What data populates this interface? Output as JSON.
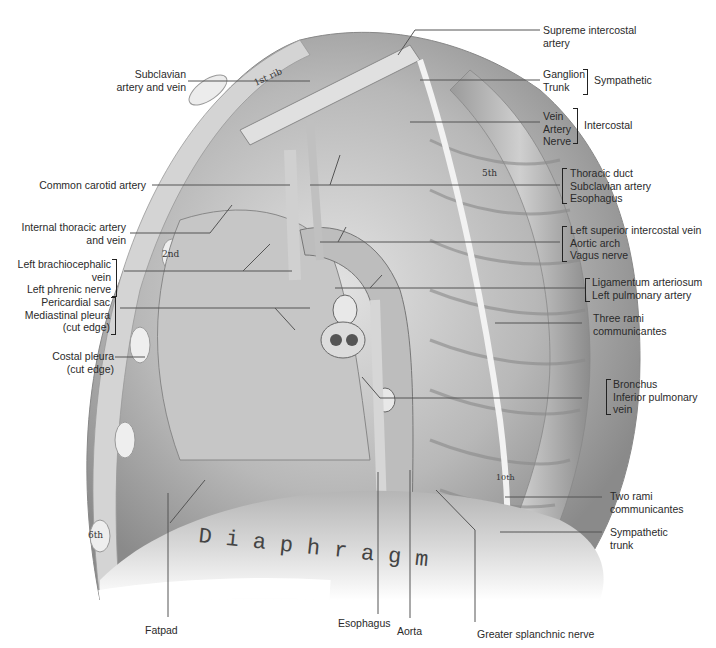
{
  "figure": {
    "type": "anatomical illustration",
    "diaphragm_text": "Diaphragm",
    "rib_labels": [
      "1st rib",
      "2nd",
      "5th",
      "6th",
      "10th"
    ]
  },
  "labels_left": [
    {
      "id": "subclavian",
      "lines": [
        "Subclavian",
        "artery and vein"
      ]
    },
    {
      "id": "common-carotid",
      "lines": [
        "Common carotid artery"
      ]
    },
    {
      "id": "internal-thoracic",
      "lines": [
        "Internal thoracic artery",
        "and vein"
      ]
    },
    {
      "id": "brachiocephalic-phrenic",
      "lines": [
        "Left brachiocephalic",
        "vein",
        "Left phrenic nerve"
      ]
    },
    {
      "id": "pericardial",
      "lines": [
        "Pericardial sac",
        "Mediastinal pleura",
        "(cut edge)"
      ]
    },
    {
      "id": "costal-pleura",
      "lines": [
        "Costal pleura",
        "(cut edge)"
      ]
    }
  ],
  "labels_right": [
    {
      "id": "supreme-intercostal",
      "lines": [
        "Supreme intercostal",
        "artery"
      ]
    },
    {
      "id": "sympathetic-group",
      "lines": [
        "Ganglion",
        "Trunk"
      ],
      "group": "Sympathetic"
    },
    {
      "id": "intercostal-group",
      "lines": [
        "Vein",
        "Artery",
        "Nerve"
      ],
      "group": "Intercostal"
    },
    {
      "id": "thoracic-duct",
      "lines": [
        "Thoracic duct",
        "Subclavian artery",
        "Esophagus"
      ]
    },
    {
      "id": "left-superior",
      "lines": [
        "Left superior intercostal vein",
        "Aortic arch",
        "Vagus nerve"
      ]
    },
    {
      "id": "ligamentum",
      "lines": [
        "Ligamentum arteriosum",
        "Left pulmonary artery"
      ]
    },
    {
      "id": "three-rami",
      "lines": [
        "Three rami",
        "communicantes"
      ]
    },
    {
      "id": "bronchus",
      "lines": [
        "Bronchus",
        "Inferior pulmonary",
        "vein"
      ]
    },
    {
      "id": "two-rami",
      "lines": [
        "Two rami",
        "communicantes"
      ]
    },
    {
      "id": "sympathetic-trunk",
      "lines": [
        "Sympathetic",
        "trunk"
      ]
    }
  ],
  "labels_bottom": [
    {
      "id": "fatpad",
      "lines": [
        "Fatpad"
      ]
    },
    {
      "id": "esophagus",
      "lines": [
        "Esophagus"
      ]
    },
    {
      "id": "aorta",
      "lines": [
        "Aorta"
      ]
    },
    {
      "id": "greater-splanchnic",
      "lines": [
        "Greater splanchnic nerve"
      ]
    }
  ],
  "colors": {
    "text": "#2a2a2a",
    "leader": "#555555",
    "drawing_dark": "#6e6e6e",
    "drawing_mid": "#a8a8a8",
    "drawing_light": "#d6d6d6"
  }
}
